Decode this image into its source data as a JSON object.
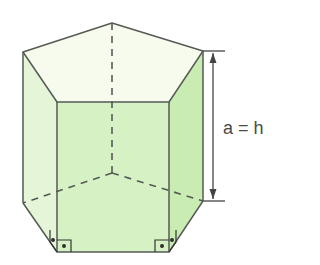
{
  "diagram": {
    "type": "pentagonal-prism",
    "dimension_label": "a = h",
    "colors": {
      "edge": "#555a55",
      "top_face": "#f6fbee",
      "front_face": "#d6f2c4",
      "right_face": "#c8ecb2",
      "left_face": "#e4f5d8",
      "right_angle_marker": "#333333"
    },
    "vertices": {
      "top_back": [
        112,
        23
      ],
      "top_left": [
        23,
        52
      ],
      "top_front_left": [
        57,
        102
      ],
      "top_front_right": [
        169,
        102
      ],
      "top_right": [
        203,
        51
      ],
      "bottom_back_hidden": [
        112,
        173
      ],
      "bottom_left": [
        23,
        203
      ],
      "bottom_front_left": [
        57,
        252
      ],
      "bottom_front_right": [
        169,
        252
      ],
      "bottom_right": [
        203,
        201
      ]
    },
    "annotations": [
      "right-angle marker at front-left base",
      "right-angle marker at front-right base",
      "height dimension arrow"
    ]
  }
}
